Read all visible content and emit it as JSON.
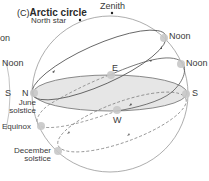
{
  "panel": {
    "letter": "(C)",
    "title": "Arctic circle"
  },
  "labels": {
    "zenith": "Zenith",
    "north_star": "North star",
    "noon_upper": "Noon",
    "noon_lower": "Noon",
    "east": "E",
    "west": "W",
    "north": "N",
    "south": "S",
    "june_solstice_line1": "June",
    "june_solstice_line2": "solstice",
    "equinox": "Equinox",
    "december_solstice_line1": "December",
    "december_solstice_line2": "solstice"
  },
  "left_panel_fragment": {
    "noon_partial": "on",
    "noon": "Noon",
    "south": "S"
  },
  "colors": {
    "line": "#6e6e6e",
    "horizon_fill": "#e6e6e6",
    "sun_marker": "#c8c8c8",
    "text": "#3a3a3a"
  }
}
